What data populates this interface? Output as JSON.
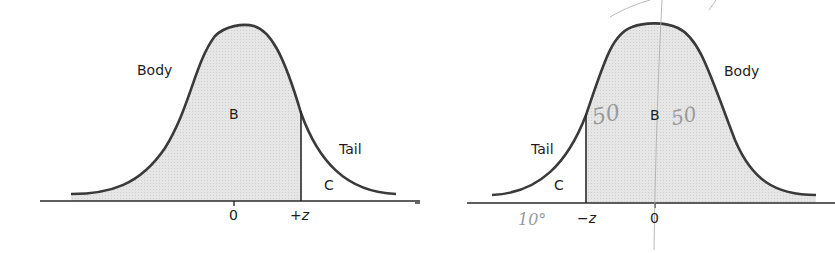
{
  "figures": [
    {
      "id": "left",
      "labels": {
        "body": "Body",
        "region_body": "B",
        "tail": "Tail",
        "region_tail": "C"
      },
      "ticks": {
        "center": "0",
        "z": "+z"
      }
    },
    {
      "id": "right",
      "labels": {
        "body": "Body",
        "region_body": "B",
        "tail": "Tail",
        "region_tail": "C"
      },
      "ticks": {
        "center": "0",
        "z": "−z"
      },
      "handwriting": {
        "left_of_b": "50",
        "right_of_b": "50",
        "under_tail": "10°"
      }
    }
  ],
  "colors": {
    "curve": "#3a3a3a",
    "shade": "#e3e3e3",
    "axis": "#2a2a2a",
    "text": "#1d1d1d",
    "pencil": "#a0a0a0"
  }
}
